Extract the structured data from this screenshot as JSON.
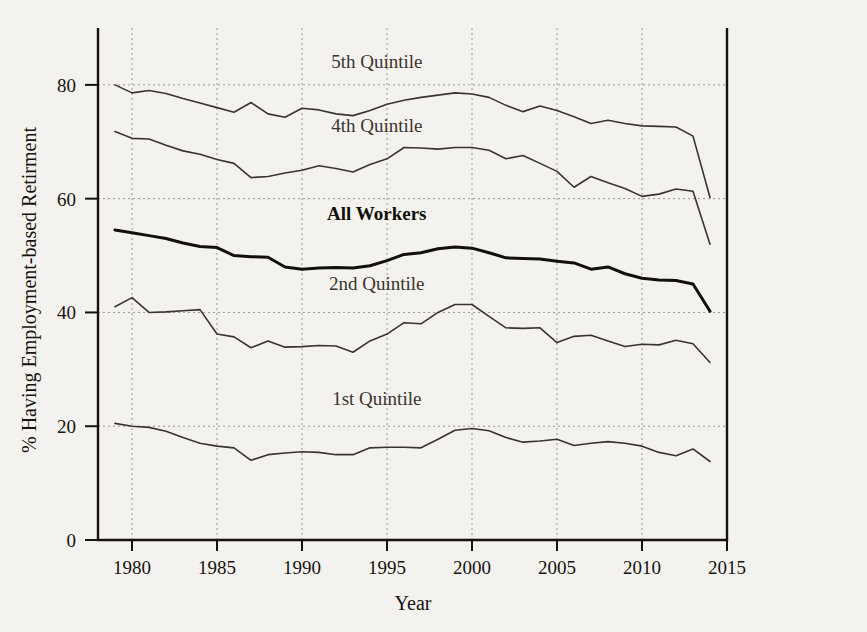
{
  "chart_data": {
    "type": "line",
    "title": "",
    "xlabel": "Year",
    "ylabel": "% Having Employment-based Retirment",
    "xlim": [
      1978,
      2015
    ],
    "ylim": [
      0,
      90
    ],
    "xticks": [
      1980,
      1985,
      1990,
      1995,
      2000,
      2005,
      2010,
      2015
    ],
    "xticklabels": [
      "1980",
      "1985",
      "1990",
      "1995",
      "2000",
      "2005",
      "2010",
      "2015"
    ],
    "yticks": [
      0,
      20,
      40,
      60,
      80
    ],
    "yticklabels": [
      "0",
      "20",
      "40",
      "60",
      "80"
    ],
    "grid": true,
    "legend_position": "inline-annotations",
    "x": [
      1979,
      1980,
      1981,
      1982,
      1983,
      1984,
      1985,
      1986,
      1987,
      1988,
      1989,
      1990,
      1991,
      1992,
      1993,
      1994,
      1995,
      1996,
      1997,
      1998,
      1999,
      2000,
      2001,
      2002,
      2003,
      2004,
      2005,
      2006,
      2007,
      2008,
      2009,
      2010,
      2011,
      2012,
      2013,
      2014
    ],
    "series": [
      {
        "name": "5th Quintile",
        "color": "#3a342d",
        "width": 1.6,
        "label_x": 1994.4,
        "label_y": 83.0,
        "bold": false,
        "values": [
          80.0,
          78.6,
          79.0,
          78.5,
          77.6,
          76.8,
          76.0,
          75.2,
          76.9,
          74.9,
          74.3,
          75.9,
          75.6,
          74.9,
          74.6,
          75.5,
          76.6,
          77.3,
          77.8,
          78.2,
          78.6,
          78.4,
          77.8,
          76.4,
          75.3,
          76.3,
          75.5,
          74.4,
          73.2,
          73.8,
          73.2,
          72.8,
          72.7,
          72.6,
          71.0,
          60.2
        ]
      },
      {
        "name": "4th Quintile",
        "color": "#3a342d",
        "width": 1.6,
        "label_x": 1994.4,
        "label_y": 71.8,
        "bold": false,
        "values": [
          71.8,
          70.6,
          70.5,
          69.4,
          68.4,
          67.8,
          66.9,
          66.2,
          63.7,
          63.9,
          64.5,
          65.0,
          65.8,
          65.3,
          64.7,
          66.0,
          67.0,
          69.0,
          68.9,
          68.7,
          69.0,
          69.0,
          68.5,
          67.0,
          67.6,
          66.2,
          64.8,
          62.0,
          63.9,
          62.8,
          61.8,
          60.4,
          60.8,
          61.7,
          61.3,
          52.0
        ]
      },
      {
        "name": "All Workers",
        "color": "#121008",
        "width": 3.0,
        "label_x": 1994.4,
        "label_y": 56.2,
        "bold": true,
        "values": [
          54.5,
          54.0,
          53.5,
          53.0,
          52.2,
          51.6,
          51.4,
          50.0,
          49.8,
          49.7,
          48.0,
          47.6,
          47.8,
          47.9,
          47.8,
          48.2,
          49.1,
          50.2,
          50.5,
          51.2,
          51.5,
          51.3,
          50.5,
          49.6,
          49.5,
          49.4,
          49.0,
          48.7,
          47.6,
          48.0,
          46.8,
          46.0,
          45.7,
          45.6,
          45.0,
          40.2
        ]
      },
      {
        "name": "2nd Quintile",
        "color": "#3a342d",
        "width": 1.6,
        "label_x": 1994.4,
        "label_y": 44.0,
        "bold": false,
        "values": [
          41.0,
          42.6,
          40.0,
          40.1,
          40.3,
          40.5,
          36.2,
          35.7,
          33.8,
          35.0,
          33.9,
          34.0,
          34.2,
          34.1,
          33.0,
          35.0,
          36.2,
          38.2,
          38.0,
          40.0,
          41.4,
          41.4,
          39.3,
          37.3,
          37.2,
          37.3,
          34.7,
          35.8,
          36.0,
          35.0,
          34.0,
          34.4,
          34.3,
          35.1,
          34.5,
          31.2
        ]
      },
      {
        "name": "1st Quintile",
        "color": "#3a342d",
        "width": 1.6,
        "label_x": 1994.4,
        "label_y": 23.8,
        "bold": false,
        "values": [
          20.5,
          20.0,
          19.8,
          19.1,
          18.0,
          17.0,
          16.5,
          16.2,
          14.0,
          15.0,
          15.3,
          15.5,
          15.4,
          15.0,
          15.0,
          16.2,
          16.3,
          16.3,
          16.2,
          17.7,
          19.3,
          19.6,
          19.2,
          18.0,
          17.2,
          17.4,
          17.7,
          16.6,
          17.0,
          17.3,
          17.0,
          16.5,
          15.4,
          14.8,
          16.0,
          13.8
        ]
      }
    ]
  }
}
